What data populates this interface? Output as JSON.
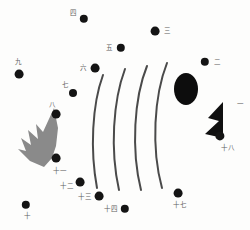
{
  "diagram": {
    "background_color": "#fdfdfc",
    "dot_color": "#141414",
    "label_color": "#5f5f5f",
    "arc_color": "#4a4a4a",
    "spiky_shape_color": "#8a8a8a",
    "flag_shape_color": "#101010",
    "ellipse_color": "#0d0d0d"
  },
  "points": [
    {
      "id": "1",
      "label": "一",
      "x": 240,
      "y": 104,
      "dot_x": 222,
      "dot_y": 104,
      "dot_r": 0,
      "label_visible": true
    },
    {
      "id": "2",
      "label": "二",
      "x": 217,
      "y": 62,
      "dot_x": 205,
      "dot_y": 62,
      "dot_r": 4.2,
      "label_visible": true
    },
    {
      "id": "3",
      "label": "三",
      "x": 167,
      "y": 31,
      "dot_x": 155,
      "dot_y": 31,
      "dot_r": 4.4,
      "label_visible": true
    },
    {
      "id": "4",
      "label": "四",
      "x": 73,
      "y": 13,
      "dot_x": 84,
      "dot_y": 19,
      "dot_r": 4.2,
      "label_visible": true
    },
    {
      "id": "5",
      "label": "五",
      "x": 109,
      "y": 48,
      "dot_x": 121,
      "dot_y": 48,
      "dot_r": 4.2,
      "label_visible": true
    },
    {
      "id": "6",
      "label": "六",
      "x": 83,
      "y": 68,
      "dot_x": 95,
      "dot_y": 68,
      "dot_r": 4.4,
      "label_visible": true
    },
    {
      "id": "7",
      "label": "七",
      "x": 65,
      "y": 85,
      "dot_x": 73,
      "dot_y": 93,
      "dot_r": 4.0,
      "label_visible": true
    },
    {
      "id": "8",
      "label": "八",
      "x": 52,
      "y": 105,
      "dot_x": 56,
      "dot_y": 114,
      "dot_r": 4.4,
      "label_visible": true
    },
    {
      "id": "9",
      "label": "九",
      "x": 18,
      "y": 62,
      "dot_x": 19,
      "dot_y": 74,
      "dot_r": 4.4,
      "label_visible": true
    },
    {
      "id": "10",
      "label": "十",
      "x": 27,
      "y": 216,
      "dot_x": 26,
      "dot_y": 205,
      "dot_r": 4.2,
      "label_visible": true
    },
    {
      "id": "11",
      "label": "十一",
      "x": 60,
      "y": 171,
      "dot_x": 56,
      "dot_y": 158,
      "dot_r": 4.4,
      "label_visible": true
    },
    {
      "id": "12",
      "label": "十二",
      "x": 67,
      "y": 186,
      "dot_x": 80,
      "dot_y": 182,
      "dot_r": 4.4,
      "label_visible": true
    },
    {
      "id": "13",
      "label": "十三",
      "x": 85,
      "y": 197,
      "dot_x": 99,
      "dot_y": 196,
      "dot_r": 4.4,
      "label_visible": true
    },
    {
      "id": "14",
      "label": "十四",
      "x": 111,
      "y": 209,
      "dot_x": 125,
      "dot_y": 209,
      "dot_r": 4.2,
      "label_visible": true
    },
    {
      "id": "17",
      "label": "十七",
      "x": 180,
      "y": 205,
      "dot_x": 178,
      "dot_y": 193,
      "dot_r": 4.4,
      "label_visible": true
    },
    {
      "id": "18",
      "label": "十八",
      "x": 228,
      "y": 148,
      "dot_x": 220,
      "dot_y": 136,
      "dot_r": 4.6,
      "label_visible": true
    }
  ],
  "arcs": [
    {
      "name": "arc-1",
      "path": "M 103 75 C 92 105 90 150 97 188"
    },
    {
      "name": "arc-2",
      "path": "M 125 69 C 113 101 110 150 119 190"
    },
    {
      "name": "arc-3",
      "path": "M 147 66 C 134 98 131 150 141 190"
    },
    {
      "name": "arc-4",
      "path": "M 167 63 C 154 96 151 148 162 188"
    }
  ],
  "ellipse": {
    "name": "center-ellipse",
    "cx": 186,
    "cy": 89,
    "rx": 12,
    "ry": 16
  },
  "spiky_shape": {
    "name": "jagged-leaf-shape",
    "path": "M 54 108 L 43 132 L 36 124 L 38 139 L 28 130 L 31 145 L 21 138 L 26 151 L 18 149 L 30 161 L 44 167 L 52 158 L 56 146 L 58 128 Z"
  },
  "flag_shape": {
    "name": "black-flag-shape",
    "path": "M 223 102 L 223 138 L 205 134 L 219 121 L 208 118 Z"
  }
}
